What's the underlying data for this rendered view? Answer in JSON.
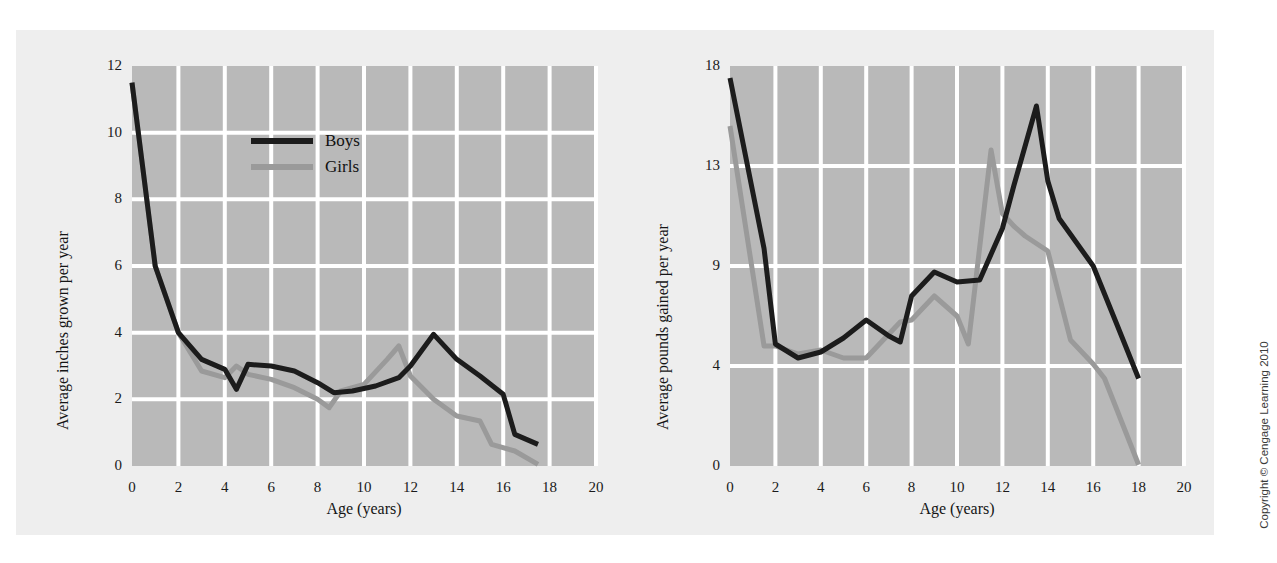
{
  "figure": {
    "copyright": "Copyright © Cengage Learning 2010",
    "background_color": "#ffffff",
    "panel_color": "#eeeeee",
    "plot_background_color": "#b9b9b9",
    "gridline_color": "#ffffff"
  },
  "legend": {
    "position": "inside-top-left",
    "entries": [
      {
        "label": "Boys",
        "color": "#1c1c1c"
      },
      {
        "label": "Girls",
        "color": "#9a9a9a"
      }
    ]
  },
  "chart_data": [
    {
      "id": "height-velocity",
      "type": "line",
      "title": "",
      "xlabel": "Age (years)",
      "ylabel": "Average inches grown per year",
      "xlim": [
        0,
        20
      ],
      "ylim": [
        0,
        12
      ],
      "xticks": [
        0,
        2,
        4,
        6,
        8,
        10,
        12,
        14,
        16,
        18,
        20
      ],
      "xtick_labels": [
        "0",
        "2",
        "4",
        "6",
        "8",
        "10",
        "12",
        "14",
        "16",
        "18",
        "20"
      ],
      "yticks": [
        0,
        2,
        4,
        6,
        8,
        10,
        12
      ],
      "ytick_labels": [
        "0",
        "2",
        "4",
        "6",
        "8",
        "10",
        "12"
      ],
      "grid": true,
      "legend": [
        "Boys",
        "Girls"
      ],
      "series": [
        {
          "name": "Boys",
          "color": "#1c1c1c",
          "x": [
            0,
            1,
            2,
            3,
            4,
            4.5,
            5,
            6,
            7,
            8,
            8.7,
            9.5,
            10.5,
            11.5,
            12,
            13,
            14,
            15,
            16,
            16.5,
            17.5
          ],
          "values": [
            11.5,
            6.0,
            4.0,
            3.2,
            2.9,
            2.3,
            3.05,
            3.0,
            2.85,
            2.5,
            2.2,
            2.25,
            2.4,
            2.65,
            3.0,
            3.95,
            3.2,
            2.7,
            2.15,
            0.95,
            0.65
          ]
        },
        {
          "name": "Girls",
          "color": "#9a9a9a",
          "x": [
            0,
            1,
            2,
            3,
            4,
            4.5,
            5,
            6,
            7,
            8,
            8.5,
            9,
            10,
            11,
            11.5,
            12,
            13,
            14,
            15,
            15.5,
            16.5,
            17.5
          ],
          "values": [
            11.5,
            6.0,
            4.0,
            2.85,
            2.65,
            3.0,
            2.75,
            2.6,
            2.35,
            2.0,
            1.75,
            2.25,
            2.45,
            3.2,
            3.6,
            2.7,
            2.0,
            1.5,
            1.35,
            0.65,
            0.45,
            0.05
          ]
        }
      ]
    },
    {
      "id": "weight-velocity",
      "type": "line",
      "title": "",
      "xlabel": "Age (years)",
      "ylabel": "Average pounds gained per year",
      "xlim": [
        0,
        20
      ],
      "ylim": [
        0,
        18
      ],
      "xticks": [
        0,
        2,
        4,
        6,
        8,
        10,
        12,
        14,
        16,
        18,
        20
      ],
      "xtick_labels": [
        "0",
        "2",
        "4",
        "6",
        "8",
        "10",
        "12",
        "14",
        "16",
        "18",
        "20"
      ],
      "yticks": [
        0,
        4,
        9,
        13,
        18
      ],
      "ytick_labels": [
        "0",
        "4",
        "9",
        "13",
        "18"
      ],
      "grid": true,
      "legend": [
        "Boys",
        "Girls"
      ],
      "series": [
        {
          "name": "Boys",
          "color": "#1c1c1c",
          "x": [
            0,
            1.5,
            2,
            3,
            4,
            5,
            6,
            7,
            7.5,
            8,
            9,
            10,
            11,
            12,
            12.5,
            13.5,
            14,
            14.5,
            16,
            17,
            18
          ],
          "values": [
            17.4,
            9.7,
            5.1,
            4.4,
            4.7,
            5.4,
            6.3,
            5.5,
            5.2,
            7.5,
            8.7,
            8.2,
            8.3,
            10.5,
            12.2,
            16.0,
            12.4,
            10.9,
            9.0,
            6.2,
            3.5
          ]
        },
        {
          "name": "Girls",
          "color": "#9a9a9a",
          "x": [
            0,
            1.5,
            2,
            3,
            4,
            5,
            6,
            7,
            7.5,
            8,
            9,
            10,
            10.5,
            11.5,
            12,
            12.5,
            13,
            14,
            15,
            16,
            16.5,
            18
          ],
          "values": [
            15.0,
            5.0,
            5.0,
            4.6,
            4.8,
            4.4,
            4.4,
            5.6,
            6.2,
            6.3,
            7.5,
            6.5,
            5.1,
            13.8,
            11.1,
            10.6,
            10.2,
            9.6,
            5.3,
            4.1,
            3.5,
            0.05
          ]
        }
      ]
    }
  ]
}
